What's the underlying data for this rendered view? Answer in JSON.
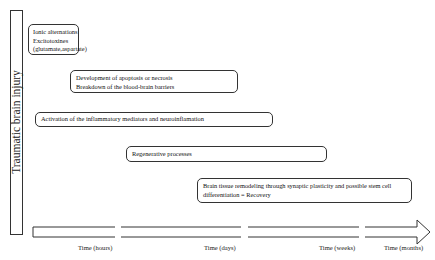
{
  "diagram": {
    "vertical_label": "Traumatic brain injury",
    "boxes": [
      {
        "lines": [
          "Ionic alternations",
          "Excitotoxines",
          "(glutamate,aspartate)"
        ]
      },
      {
        "lines": [
          "Development of apoptosis or necrosis",
          "Breakdown of the blood-brain barriers"
        ]
      },
      {
        "lines": [
          "Activation of the inflammatory mediators and neuroinflamation"
        ]
      },
      {
        "lines": [
          "Regenerative processes"
        ]
      },
      {
        "lines": [
          "Brain tissue remodeling through synaptic plasticity and possible stem cell",
          "differentiation = Recovery"
        ]
      }
    ],
    "time_axis": {
      "labels": [
        "Time (hours)",
        "Time (days)",
        "Time (weeks)",
        "Time (months)"
      ]
    },
    "colors": {
      "stroke": "#333333",
      "background": "#ffffff"
    }
  }
}
